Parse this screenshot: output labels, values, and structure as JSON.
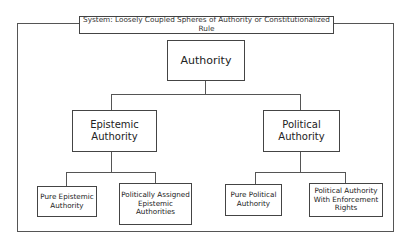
{
  "diagram": {
    "system_title": "System: Loosely Coupled Spheres of Authority or Constitutionalized Rule",
    "root": {
      "label": "Authority"
    },
    "branches": [
      {
        "label_line1": "Epistemic",
        "label_line2": "Authority",
        "children": [
          {
            "lines": [
              "Pure Epistemic",
              "Authority"
            ]
          },
          {
            "lines": [
              "Politically Assigned",
              "Epistemic",
              "Authorities"
            ]
          }
        ]
      },
      {
        "label_line1": "Political",
        "label_line2": "Authority",
        "children": [
          {
            "lines": [
              "Pure Political",
              "Authority"
            ]
          },
          {
            "lines": [
              "Political Authority",
              "With Enforcement",
              "Rights"
            ]
          }
        ]
      }
    ],
    "colors": {
      "line": "#555555",
      "border": "#444444",
      "background": "#ffffff"
    }
  }
}
